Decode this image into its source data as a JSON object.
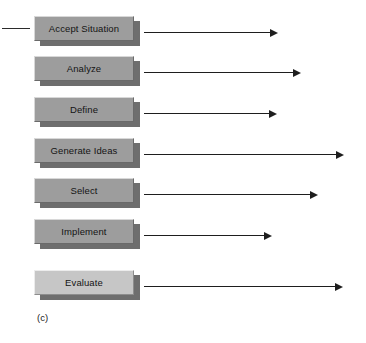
{
  "figure": {
    "caption": "(c)",
    "caption_x": 37,
    "caption_y": 312,
    "width": 366,
    "height": 343,
    "background": "#ffffff"
  },
  "colors": {
    "box_fill": "#9d9d9d",
    "box_fill_light": "#c6c6c6",
    "box_highlight": "#d8d8d8",
    "box_lowlight": "#6a6a6a",
    "shadow": "#6e6e6e",
    "line": "#1e1e1e",
    "text": "#141414"
  },
  "stub": {
    "name": "left-connector-line",
    "x": 2,
    "y": 28,
    "length": 28
  },
  "steps": [
    {
      "label": "Accept Situation",
      "box_top": 16,
      "arrow_start": 144,
      "arrow_end": 278,
      "shade": "dark"
    },
    {
      "label": "Analyze",
      "box_top": 56,
      "arrow_start": 144,
      "arrow_end": 301,
      "shade": "dark"
    },
    {
      "label": "Define",
      "box_top": 97,
      "arrow_start": 144,
      "arrow_end": 277,
      "shade": "dark"
    },
    {
      "label": "Generate Ideas",
      "box_top": 138,
      "arrow_start": 144,
      "arrow_end": 344,
      "shade": "dark"
    },
    {
      "label": "Select",
      "box_top": 178,
      "arrow_start": 144,
      "arrow_end": 318,
      "shade": "dark"
    },
    {
      "label": "Implement",
      "box_top": 219,
      "arrow_start": 144,
      "arrow_end": 272,
      "shade": "dark"
    },
    {
      "label": "Evaluate",
      "box_top": 270,
      "arrow_start": 144,
      "arrow_end": 343,
      "shade": "light"
    }
  ]
}
